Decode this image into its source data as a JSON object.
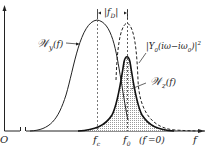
{
  "figure": {
    "type": "spectral-density-diagram",
    "origin_label": "O",
    "x_axis_label": "f",
    "curves": [
      {
        "name": "Wy",
        "label": "𝒲y(f)",
        "style": "solid"
      },
      {
        "name": "Y0",
        "label": "|Y0(iω−iω0)|²",
        "style": "dashed"
      },
      {
        "name": "Wz",
        "label": "𝒲z(f)",
        "style": "solid-shaded"
      }
    ],
    "annotations": {
      "fd_label": "|fD|",
      "fc_label": "fc",
      "f0_label": "f0",
      "f0_note": "(f′=0)"
    },
    "colors": {
      "ink": "#222222",
      "shade": "#bbbbbb"
    }
  },
  "labels": {
    "wy": "𝒲",
    "wy_sub": "y",
    "wy_arg": "(f)",
    "y0": "|Y",
    "y0_sub": "0",
    "y0_arg": "(iω−iω",
    "y0_sub2": "0",
    "y0_close": ")|",
    "y0_sup": "2",
    "wz": "𝒲",
    "wz_sub": "z",
    "wz_arg": "(f)",
    "fd_open": "|f",
    "fd_sub": "D",
    "fd_close": "|",
    "fc": "f",
    "fc_sub": "c",
    "f0": "f",
    "f0_sub": "0",
    "f0_note": "(f′=0)",
    "f_axis": "f",
    "origin": "O"
  }
}
